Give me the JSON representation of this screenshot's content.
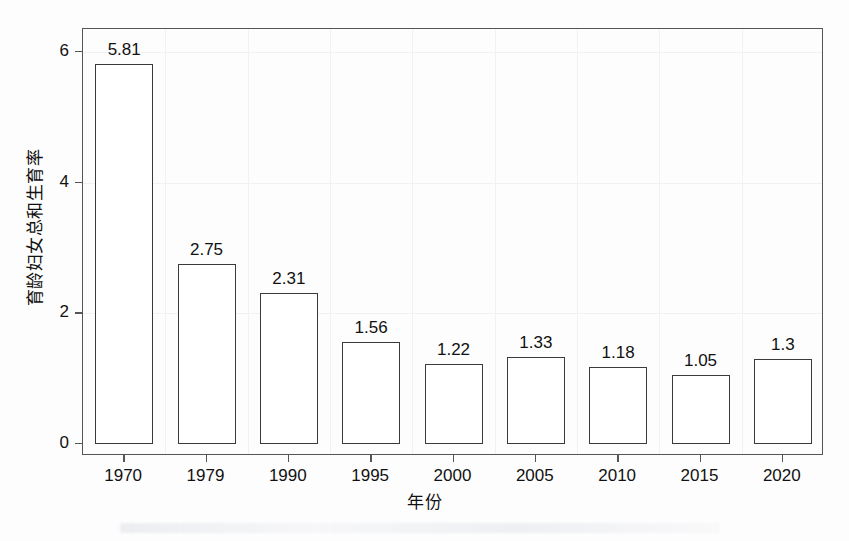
{
  "chart_data": {
    "type": "bar",
    "title": "",
    "xlabel": "年份",
    "ylabel": "育龄妇女总和生育率",
    "categories": [
      "1970",
      "1979",
      "1990",
      "1995",
      "2000",
      "2005",
      "2010",
      "2015",
      "2020"
    ],
    "values": [
      5.81,
      2.75,
      2.31,
      1.56,
      1.22,
      1.33,
      1.18,
      1.05,
      1.3
    ],
    "data_labels": [
      "5.81",
      "2.75",
      "2.31",
      "1.56",
      "1.22",
      "1.33",
      "1.18",
      "1.05",
      "1.3"
    ],
    "ylim": [
      0,
      6.35
    ],
    "yticks": [
      0,
      2,
      4,
      6
    ],
    "ytick_labels": [
      "0",
      "2",
      "4",
      "6"
    ],
    "grid": true,
    "legend": null,
    "bar_fill_color": "#ffffff",
    "bar_edge_color": "#3a3a3a",
    "axis_color": "#555555",
    "grid_color": "#f1f1f3",
    "background_color": "#fdfdfd",
    "text_color": "#111111"
  }
}
